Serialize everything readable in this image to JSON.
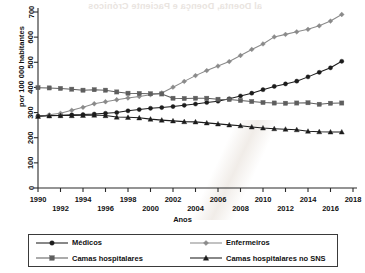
{
  "artifact": {
    "bleed_text": "al Doenta, Doença e Paciente Crónicos"
  },
  "chart_data": {
    "type": "line",
    "title": "",
    "xlabel": "Anos",
    "ylabel": "por 100 000 habitantes",
    "xlim": [
      1990,
      2018
    ],
    "ylim": [
      0,
      700
    ],
    "ytick_labels": [
      "0",
      "100",
      "200",
      "300",
      "400",
      "500",
      "600",
      "700"
    ],
    "ytick_values": [
      0,
      100,
      200,
      300,
      400,
      500,
      600,
      700
    ],
    "xtick_values": [
      1990,
      1992,
      1994,
      1996,
      1998,
      2000,
      2002,
      2004,
      2006,
      2008,
      2010,
      2012,
      2014,
      2016,
      2018
    ],
    "xtick_labels_top": [
      "1990",
      "1994",
      "1998",
      "2002",
      "2006",
      "2010",
      "2014",
      "2018"
    ],
    "xtick_labels_bottom": [
      "1992",
      "1996",
      "2000",
      "2004",
      "2008",
      "2012",
      "2016"
    ],
    "grid": false,
    "legend_position": "bottom",
    "x": [
      1990,
      1991,
      1992,
      1993,
      1994,
      1995,
      1996,
      1997,
      1998,
      1999,
      2000,
      2001,
      2002,
      2003,
      2004,
      2005,
      2006,
      2007,
      2008,
      2009,
      2010,
      2011,
      2012,
      2013,
      2014,
      2015,
      2016,
      2017
    ],
    "series": [
      {
        "name": "Médicos",
        "marker": "circle",
        "color": "#1c1c1c",
        "values": [
          286,
          288,
          289,
          291,
          292,
          294,
          297,
          300,
          307,
          312,
          317,
          320,
          324,
          329,
          334,
          340,
          345,
          355,
          366,
          377,
          391,
          404,
          414,
          425,
          442,
          460,
          478,
          504
        ]
      },
      {
        "name": "Enfermeiros",
        "marker": "diamond",
        "color": "#8a8a8a",
        "values": [
          283,
          291,
          297,
          309,
          321,
          335,
          343,
          351,
          358,
          364,
          371,
          378,
          401,
          424,
          447,
          467,
          485,
          503,
          527,
          551,
          573,
          601,
          611,
          621,
          631,
          645,
          664,
          690
        ]
      },
      {
        "name": "Camas hospitalares",
        "marker": "square",
        "color": "#5e5e5e",
        "values": [
          399,
          398,
          396,
          393,
          389,
          391,
          389,
          382,
          377,
          376,
          375,
          374,
          357,
          356,
          357,
          357,
          353,
          352,
          348,
          344,
          340,
          338,
          337,
          338,
          339,
          333,
          337,
          338
        ]
      },
      {
        "name": "Camas hospitalares no SNS",
        "marker": "triangle",
        "color": "#1c1c1c",
        "values": [
          285,
          287,
          288,
          288,
          289,
          290,
          288,
          282,
          281,
          279,
          274,
          270,
          267,
          264,
          263,
          259,
          255,
          251,
          248,
          243,
          239,
          236,
          234,
          232,
          226,
          224,
          223,
          223
        ]
      }
    ],
    "legend": [
      {
        "label": "Médicos",
        "marker": "circle",
        "color": "#1c1c1c"
      },
      {
        "label": "Enfermeiros",
        "marker": "diamond",
        "color": "#8a8a8a"
      },
      {
        "label": "Camas hospitalares",
        "marker": "square",
        "color": "#5e5e5e"
      },
      {
        "label": "Camas hospitalares no SNS",
        "marker": "triangle",
        "color": "#1c1c1c"
      }
    ]
  }
}
